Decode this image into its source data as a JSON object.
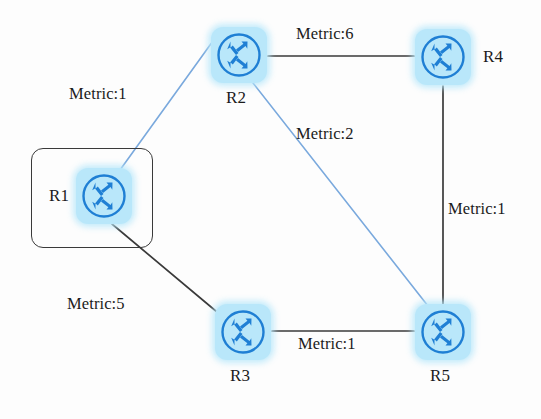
{
  "diagram": {
    "width": 541,
    "height": 419,
    "background": "#ffffff",
    "node_fill": "#b9e7fa",
    "node_stroke": "#1f7fd4",
    "blue_link_color": "#7aa9dd",
    "black_link_color": "#3a3a3a",
    "group_box_color": "#3a3a3a"
  },
  "nodes": [
    {
      "id": "R1",
      "label": "R1",
      "icon": "router-icon",
      "cx": 104,
      "cy": 196,
      "label_x": 49,
      "label_y": 186,
      "grouped": true
    },
    {
      "id": "R2",
      "label": "R2",
      "icon": "router-icon",
      "cx": 239,
      "cy": 55,
      "label_x": 226,
      "label_y": 88,
      "grouped": false
    },
    {
      "id": "R3",
      "label": "R3",
      "icon": "router-icon",
      "cx": 243,
      "cy": 332,
      "label_x": 230,
      "label_y": 366,
      "grouped": false
    },
    {
      "id": "R4",
      "label": "R4",
      "icon": "router-icon",
      "cx": 443,
      "cy": 57,
      "label_x": 483,
      "label_y": 47,
      "grouped": false
    },
    {
      "id": "R5",
      "label": "R5",
      "icon": "router-icon",
      "cx": 443,
      "cy": 332,
      "label_x": 430,
      "label_y": 366,
      "grouped": false
    }
  ],
  "group_box": {
    "x": 31,
    "y": 148,
    "width": 120,
    "height": 98
  },
  "links": [
    {
      "id": "r1-r2",
      "from": "R1",
      "to": "R2",
      "metric": 1,
      "label": "Metric:1",
      "color": "blue",
      "label_x": 69,
      "label_y": 84
    },
    {
      "id": "r2-r4",
      "from": "R2",
      "to": "R4",
      "metric": 6,
      "label": "Metric:6",
      "color": "black",
      "label_x": 296,
      "label_y": 24
    },
    {
      "id": "r2-r5",
      "from": "R2",
      "to": "R5",
      "metric": 2,
      "label": "Metric:2",
      "color": "blue",
      "label_x": 296,
      "label_y": 124
    },
    {
      "id": "r4-r5",
      "from": "R4",
      "to": "R5",
      "metric": 1,
      "label": "Metric:1",
      "color": "black",
      "label_x": 448,
      "label_y": 199
    },
    {
      "id": "r1-r3",
      "from": "R1",
      "to": "R3",
      "metric": 5,
      "label": "Metric:5",
      "color": "black",
      "label_x": 67,
      "label_y": 294
    },
    {
      "id": "r3-r5",
      "from": "R3",
      "to": "R5",
      "metric": 1,
      "label": "Metric:1",
      "color": "black",
      "label_x": 298,
      "label_y": 334
    }
  ]
}
